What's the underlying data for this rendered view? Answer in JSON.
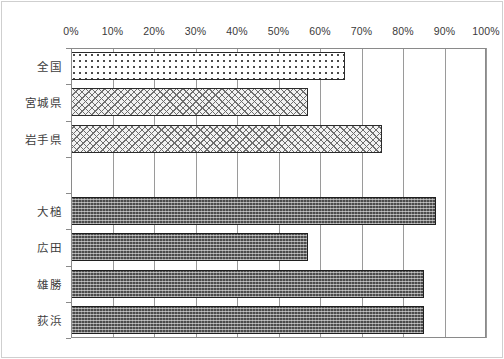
{
  "chart_data": {
    "type": "bar",
    "orientation": "horizontal",
    "title": "",
    "subtitle": "",
    "xlabel": "",
    "ylabel": "",
    "xlim": [
      0,
      100
    ],
    "xtick_labels": [
      "0%",
      "10%",
      "20%",
      "30%",
      "40%",
      "50%",
      "60%",
      "70%",
      "80%",
      "90%",
      "100%"
    ],
    "xtick_values": [
      0,
      10,
      20,
      30,
      40,
      50,
      60,
      70,
      80,
      90,
      100
    ],
    "grid": "vertical",
    "legend": "none",
    "axis_label_position": "top",
    "categories": [
      "全国",
      "宮城県",
      "岩手県",
      "",
      "大槌",
      "広田",
      "雄勝",
      "荻浜"
    ],
    "values": [
      66,
      57,
      75,
      null,
      88,
      57,
      85,
      85
    ],
    "bars": [
      {
        "label": "全国",
        "value": 66,
        "fill": "fill-dots",
        "slot": 0
      },
      {
        "label": "宮城県",
        "value": 57,
        "fill": "fill-crosshatch",
        "slot": 1
      },
      {
        "label": "岩手県",
        "value": 75,
        "fill": "fill-crosshatch",
        "slot": 2
      },
      {
        "label": "大槌",
        "value": 88,
        "fill": "fill-dense-dark",
        "slot": 4
      },
      {
        "label": "広田",
        "value": 57,
        "fill": "fill-dense-dark",
        "slot": 5
      },
      {
        "label": "雄勝",
        "value": 85,
        "fill": "fill-dense-dark",
        "slot": 6
      },
      {
        "label": "荻浜",
        "value": 85,
        "fill": "fill-dense-dark",
        "slot": 7
      }
    ],
    "colors": {
      "background": "#ffffff",
      "axis": "#8a8a8a",
      "gridline": "#9a9a9a",
      "text": "#3d3d3d",
      "bar_light_outline": "#2b2b2b",
      "bar_dark_fill": "#4b4b4b"
    }
  }
}
